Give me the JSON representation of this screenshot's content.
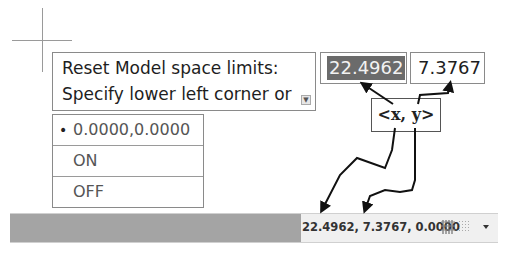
{
  "command_prompt": {
    "line1": "Reset Model space limits:",
    "line2": "Specify lower left corner or",
    "icon": "down-arrow-expand-icon"
  },
  "dynamic_input": {
    "x_value": "22.4962",
    "y_value": "7.3767"
  },
  "annotation": {
    "label": "<x, y>"
  },
  "options": [
    {
      "label": "0.0000,0.0000",
      "bullet": "•",
      "selected": true
    },
    {
      "label": "ON",
      "selected": false
    },
    {
      "label": "OFF",
      "selected": false
    }
  ],
  "status_bar": {
    "coordinates": "22.4962, 7.3767, 0.0000",
    "icons": [
      "grid-display-icon",
      "snap-mode-icon",
      "customization-menu-icon"
    ]
  },
  "colors": {
    "selection_bg": "#6b6b6b",
    "status_fill": "#a4a4a4",
    "border": "#8a8a8a"
  }
}
